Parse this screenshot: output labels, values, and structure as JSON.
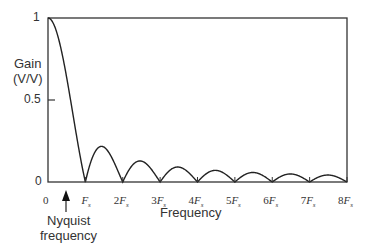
{
  "chart_data": {
    "type": "line",
    "title": "",
    "xlabel": "Frequency",
    "ylabel": "Gain (V/V)",
    "ylabel_lines": [
      "Gain",
      "(V/V)"
    ],
    "x_ticks": [
      "0",
      "Fs",
      "2Fs",
      "3Fs",
      "4Fs",
      "5Fs",
      "6Fs",
      "7Fs",
      "8Fs"
    ],
    "y_ticks": [
      "0",
      "0.5",
      "1"
    ],
    "xlim": [
      0,
      8
    ],
    "ylim": [
      0,
      1
    ],
    "grid": false,
    "series": [
      {
        "name": "|sinc(f/Fs)| gain",
        "x_units": "Fs",
        "x": [
          0,
          0.25,
          0.5,
          0.75,
          1,
          1.5,
          2,
          2.5,
          3,
          3.5,
          4,
          4.5,
          5,
          5.5,
          6,
          6.5,
          7,
          7.5,
          8
        ],
        "values": [
          1,
          0.9,
          0.64,
          0.3,
          0,
          0.21,
          0,
          0.13,
          0,
          0.09,
          0,
          0.07,
          0,
          0.06,
          0,
          0.05,
          0,
          0.04,
          0
        ]
      }
    ],
    "annotations": [
      {
        "text": "Nyquist frequency",
        "x": 0.5,
        "type": "arrow-up"
      }
    ]
  },
  "labels": {
    "y_axis_1": "Gain",
    "y_axis_2": "(V/V)",
    "x_axis": "Frequency",
    "y_tick_1": "1",
    "y_tick_05": "0.5",
    "y_tick_0": "0",
    "nyquist_1": "Nyquist",
    "nyquist_2": "frequency",
    "x_tick_0": "0",
    "x_ticks_num": [
      "",
      "2",
      "3",
      "4",
      "5",
      "6",
      "7",
      "8"
    ]
  }
}
